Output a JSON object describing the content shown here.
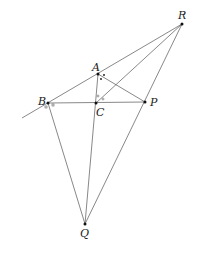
{
  "diagram": {
    "type": "geometry",
    "points": {
      "R": {
        "label": "R",
        "x": 182,
        "y": 24
      },
      "A": {
        "label": "A",
        "x": 98,
        "y": 74
      },
      "B": {
        "label": "B",
        "x": 48,
        "y": 103
      },
      "C": {
        "label": "C",
        "x": 96,
        "y": 103
      },
      "P": {
        "label": "P",
        "x": 145,
        "y": 102
      },
      "Q": {
        "label": "Q",
        "x": 85,
        "y": 224
      }
    },
    "segments": [
      [
        "R",
        "B_ext"
      ],
      [
        "R",
        "C"
      ],
      [
        "R",
        "Q"
      ],
      [
        "A",
        "P"
      ],
      [
        "A",
        "C"
      ],
      [
        "B",
        "P"
      ],
      [
        "B",
        "Q"
      ],
      [
        "C",
        "Q"
      ]
    ],
    "angle_marks": [
      "small squares at B",
      "small circles at C",
      "dots at A"
    ]
  }
}
